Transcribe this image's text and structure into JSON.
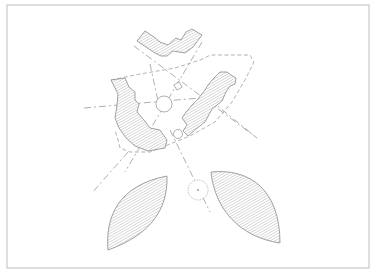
{
  "drawing": {
    "type": "architectural site plan",
    "colors": {
      "background": "#ffffff",
      "frame": "#c8c8c8",
      "line": "#8a8a8a",
      "hatch": "#9a9a9a"
    },
    "frame": {
      "x": 7,
      "y": 5,
      "width": 362,
      "height": 263
    },
    "elements": [
      {
        "name": "north-stepped-building",
        "kind": "hatched-block"
      },
      {
        "name": "west-curved-building",
        "kind": "hatched-block"
      },
      {
        "name": "east-stepped-building",
        "kind": "hatched-block"
      },
      {
        "name": "southwest-lens-mass",
        "kind": "hatched-lens"
      },
      {
        "name": "southeast-lens-mass",
        "kind": "hatched-lens"
      },
      {
        "name": "central-circle",
        "kind": "circle"
      },
      {
        "name": "small-circle",
        "kind": "circle"
      },
      {
        "name": "tree-symbol",
        "kind": "tree"
      },
      {
        "name": "site-boundary",
        "kind": "dashed-outline"
      },
      {
        "name": "axis-lines",
        "kind": "dash-dot-lines",
        "count": 5
      }
    ]
  }
}
